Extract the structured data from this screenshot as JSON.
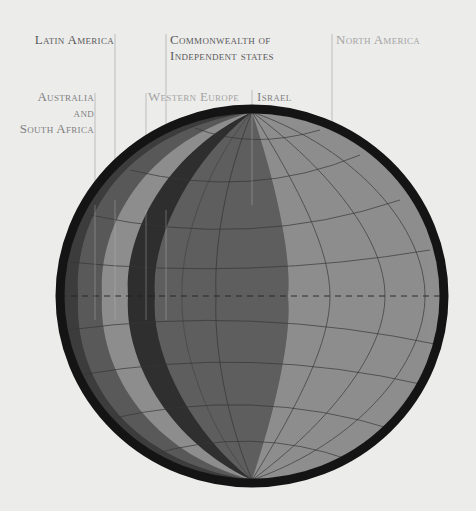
{
  "diagram": {
    "type": "globe-segment-diagram",
    "colors": {
      "background": "#ececeb",
      "rim": "#141414",
      "band_outer_dark": "#3a3a3a",
      "band_dark_gray": "#5c5c5c",
      "band_light_gray": "#8e8e8e",
      "band_very_dark": "#2e2e2e",
      "band_israel": "#5e5e5e",
      "band_north_america": "#8f8f8f",
      "gridline": "#3a3a3a",
      "leader_line": "#b9b9b9"
    },
    "labels": [
      {
        "id": "latin-america",
        "text": "Latin America",
        "tone": "dark"
      },
      {
        "id": "cis",
        "line1": "Commonwealth of",
        "line2": "Independent states",
        "tone": "dark"
      },
      {
        "id": "north-america",
        "text": "North America",
        "tone": "light"
      },
      {
        "id": "australia-south-africa",
        "line1": "Australia",
        "line2": "and",
        "line3": "South Africa",
        "tone": "mid"
      },
      {
        "id": "western-europe",
        "text": "Western Europe",
        "tone": "light"
      },
      {
        "id": "israel",
        "text": "Israel",
        "tone": "mid"
      }
    ],
    "segments_left_to_right": [
      "Australia and South Africa",
      "Latin America",
      "Western Europe",
      "Commonwealth of Independent states",
      "Israel",
      "North America"
    ],
    "equator_style": "dashed"
  }
}
